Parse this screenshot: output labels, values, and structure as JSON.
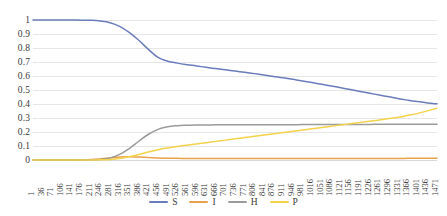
{
  "chart_data": {
    "type": "line",
    "title": "",
    "subtitle": "",
    "xlabel": "",
    "ylabel": "",
    "xlim": [
      1,
      1471
    ],
    "ylim": [
      0,
      1
    ],
    "grid": true,
    "legend_position": "bottom",
    "y_ticks": [
      "1",
      "0.9",
      "0.8",
      "0.7",
      "0.6",
      "0.5",
      "0.4",
      "0.3",
      "0.2",
      "0.1",
      "0"
    ],
    "y_tick_values": [
      1,
      0.9,
      0.8,
      0.7,
      0.6,
      0.5,
      0.4,
      0.3,
      0.2,
      0.1,
      0
    ],
    "x_ticks": [
      "1",
      "36",
      "71",
      "106",
      "141",
      "176",
      "211",
      "246",
      "281",
      "316",
      "351",
      "386",
      "421",
      "456",
      "491",
      "526",
      "561",
      "596",
      "631",
      "666",
      "701",
      "736",
      "771",
      "806",
      "841",
      "876",
      "911",
      "946",
      "981",
      "1016",
      "1051",
      "1086",
      "1121",
      "1156",
      "1191",
      "1226",
      "1261",
      "1296",
      "1331",
      "1366",
      "1401",
      "1436",
      "1471"
    ],
    "x_tick_values": [
      1,
      36,
      71,
      106,
      141,
      176,
      211,
      246,
      281,
      316,
      351,
      386,
      421,
      456,
      491,
      526,
      561,
      596,
      631,
      666,
      701,
      736,
      771,
      806,
      841,
      876,
      911,
      946,
      981,
      1016,
      1051,
      1086,
      1121,
      1156,
      1191,
      1226,
      1261,
      1296,
      1331,
      1366,
      1401,
      1436,
      1471
    ],
    "series": [
      {
        "name": "S",
        "color": "#6b7cbb",
        "values": [
          1.0,
          1.0,
          1.0,
          1.0,
          1.0,
          0.999,
          0.998,
          0.993,
          0.981,
          0.955,
          0.912,
          0.855,
          0.79,
          0.733,
          0.706,
          0.692,
          0.681,
          0.672,
          0.662,
          0.653,
          0.644,
          0.635,
          0.626,
          0.617,
          0.607,
          0.597,
          0.587,
          0.576,
          0.565,
          0.553,
          0.541,
          0.529,
          0.516,
          0.503,
          0.49,
          0.477,
          0.464,
          0.451,
          0.438,
          0.427,
          0.417,
          0.408,
          0.401
        ]
      },
      {
        "name": "I",
        "color": "#e8a14c",
        "values": [
          0.0,
          0.0,
          0.0,
          0.0,
          0.0,
          0.001,
          0.003,
          0.008,
          0.015,
          0.021,
          0.023,
          0.021,
          0.018,
          0.015,
          0.013,
          0.012,
          0.011,
          0.011,
          0.011,
          0.011,
          0.011,
          0.011,
          0.011,
          0.011,
          0.011,
          0.011,
          0.011,
          0.011,
          0.011,
          0.011,
          0.011,
          0.011,
          0.011,
          0.011,
          0.011,
          0.011,
          0.011,
          0.011,
          0.011,
          0.012,
          0.012,
          0.012,
          0.012
        ]
      },
      {
        "name": "H",
        "color": "#9b9b9b",
        "values": [
          0.0,
          0.0,
          0.0,
          0.0,
          0.0,
          0.0,
          0.001,
          0.004,
          0.014,
          0.04,
          0.082,
          0.134,
          0.184,
          0.219,
          0.237,
          0.245,
          0.248,
          0.25,
          0.25,
          0.251,
          0.251,
          0.251,
          0.251,
          0.251,
          0.252,
          0.252,
          0.252,
          0.252,
          0.253,
          0.253,
          0.253,
          0.253,
          0.254,
          0.254,
          0.254,
          0.254,
          0.255,
          0.255,
          0.255,
          0.255,
          0.256,
          0.256,
          0.256
        ]
      },
      {
        "name": "P",
        "color": "#f4d24a",
        "values": [
          0.0,
          0.0,
          0.0,
          0.0,
          0.0,
          0.0,
          0.0,
          0.001,
          0.004,
          0.011,
          0.023,
          0.039,
          0.057,
          0.073,
          0.086,
          0.097,
          0.106,
          0.115,
          0.124,
          0.133,
          0.142,
          0.151,
          0.16,
          0.169,
          0.178,
          0.187,
          0.196,
          0.205,
          0.214,
          0.223,
          0.232,
          0.241,
          0.25,
          0.259,
          0.268,
          0.277,
          0.286,
          0.296,
          0.306,
          0.319,
          0.333,
          0.351,
          0.369
        ]
      }
    ],
    "legend": [
      {
        "label": "S",
        "color": "#6b7cbb"
      },
      {
        "label": "I",
        "color": "#e8a14c"
      },
      {
        "label": "H",
        "color": "#9b9b9b"
      },
      {
        "label": "P",
        "color": "#f4d24a"
      }
    ],
    "gridline_color": "#e6e6e6",
    "axis_text_color": "#3a3a3a",
    "background_color": "#ffffff"
  }
}
